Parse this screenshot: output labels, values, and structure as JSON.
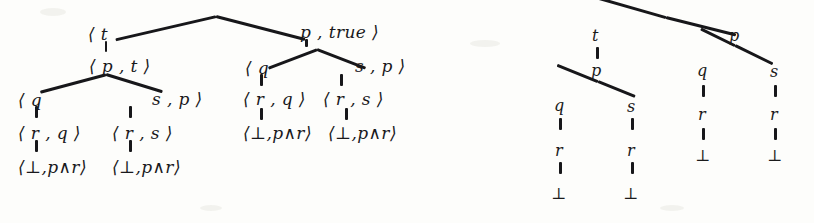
{
  "figure": {
    "background_color": "#fdfdfb",
    "ink_color": "#19191c"
  },
  "left_tree": {
    "name": "labelled-pair-tree",
    "rows": [
      {
        "row": 1,
        "nodes": [
          {
            "id": "l-r1-n1",
            "text": "⟨ t",
            "x": 88,
            "y": 26
          },
          {
            "id": "l-r1-n2",
            "text": "p , true ⟩",
            "x": 300,
            "y": 24
          }
        ]
      },
      {
        "row": 2,
        "nodes": [
          {
            "id": "l-r2-n1",
            "text": "⟨ p , t ⟩",
            "x": 89,
            "y": 58
          },
          {
            "id": "l-r2-n2",
            "text": "⟨ q",
            "x": 245,
            "y": 60
          },
          {
            "id": "l-r2-n3",
            "text": "s , p ⟩",
            "x": 355,
            "y": 58
          }
        ]
      },
      {
        "row": 3,
        "nodes": [
          {
            "id": "l-r3-n1",
            "text": "⟨ q",
            "x": 18,
            "y": 92
          },
          {
            "id": "l-r3-n2",
            "text": "s , p ⟩",
            "x": 152,
            "y": 91
          },
          {
            "id": "l-r3-n3",
            "text": "⟨ r , q ⟩",
            "x": 243,
            "y": 91
          },
          {
            "id": "l-r3-n4",
            "text": "⟨ r , s ⟩",
            "x": 323,
            "y": 91
          }
        ]
      },
      {
        "row": 4,
        "nodes": [
          {
            "id": "l-r4-n1",
            "text": "⟨ r , q ⟩",
            "x": 18,
            "y": 125
          },
          {
            "id": "l-r4-n2",
            "text": "⟨ r , s ⟩",
            "x": 112,
            "y": 125
          },
          {
            "id": "l-r4-n3",
            "text": "⟨⊥,p∧r⟩",
            "x": 243,
            "y": 125
          },
          {
            "id": "l-r4-n4",
            "text": "⟨⊥,p∧r⟩",
            "x": 328,
            "y": 125
          }
        ]
      },
      {
        "row": 5,
        "nodes": [
          {
            "id": "l-r5-n1",
            "text": "⟨⊥,p∧r⟩",
            "x": 18,
            "y": 159
          },
          {
            "id": "l-r5-n2",
            "text": "⟨⊥,p∧r⟩",
            "x": 112,
            "y": 159
          }
        ]
      }
    ],
    "symbols": {
      "angle_open": "⟨",
      "angle_close": "⟩",
      "bottom": "⊥",
      "and": "∧",
      "comma": ","
    },
    "labels": [
      "t",
      "p",
      "q",
      "s",
      "r",
      "true",
      "⊥",
      "p∧r"
    ]
  },
  "right_tree": {
    "name": "plain-formula-tree",
    "nodes": [
      {
        "id": "r-t",
        "label": "t",
        "x": 596,
        "y": 36,
        "level": 1
      },
      {
        "id": "r-p1",
        "label": "p",
        "x": 733,
        "y": 36,
        "level": 1
      },
      {
        "id": "r-p2",
        "label": "p",
        "x": 596,
        "y": 72,
        "level": 2
      },
      {
        "id": "r-q1",
        "label": "q",
        "x": 701,
        "y": 72,
        "level": 2
      },
      {
        "id": "r-s1",
        "label": "s",
        "x": 773,
        "y": 72,
        "level": 2
      },
      {
        "id": "r-q2",
        "label": "q",
        "x": 558,
        "y": 107,
        "level": 3
      },
      {
        "id": "r-s2",
        "label": "s",
        "x": 630,
        "y": 107,
        "level": 3
      },
      {
        "id": "r-r1",
        "label": "r",
        "x": 701,
        "y": 115,
        "level": 3
      },
      {
        "id": "r-r2",
        "label": "r",
        "x": 773,
        "y": 115,
        "level": 3
      },
      {
        "id": "r-r3",
        "label": "r",
        "x": 558,
        "y": 152,
        "level": 4
      },
      {
        "id": "r-r4",
        "label": "r",
        "x": 630,
        "y": 152,
        "level": 4
      },
      {
        "id": "r-b1",
        "label": "⊥",
        "x": 701,
        "y": 158,
        "level": 4
      },
      {
        "id": "r-b2",
        "label": "⊥",
        "x": 773,
        "y": 158,
        "level": 4
      },
      {
        "id": "r-b3",
        "label": "⊥",
        "x": 558,
        "y": 196,
        "level": 5
      },
      {
        "id": "r-b4",
        "label": "⊥",
        "x": 630,
        "y": 196,
        "level": 5
      }
    ],
    "apex": {
      "x": 666,
      "y": 16
    }
  }
}
